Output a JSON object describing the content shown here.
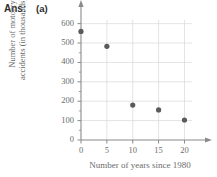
{
  "answer": {
    "prefix": "Ans:",
    "part": "(a)"
  },
  "chart_data": {
    "type": "scatter",
    "title": "",
    "xlabel": "Number of years since 1980",
    "ylabel": "Number of motorcycle accidents (in thousands)",
    "ylabel_line1": "Number of motorcycle",
    "ylabel_line2": "accidents (in thousands)",
    "x": [
      0,
      5,
      10,
      15,
      20
    ],
    "values": [
      560,
      483,
      180,
      155,
      103
    ],
    "points": [
      {
        "x": 0,
        "y": 560
      },
      {
        "x": 5,
        "y": 483
      },
      {
        "x": 10,
        "y": 180
      },
      {
        "x": 15,
        "y": 155
      },
      {
        "x": 20,
        "y": 103
      }
    ],
    "xticks": [
      0,
      5,
      10,
      15,
      20
    ],
    "xtick_labels": [
      "0",
      "5",
      "10",
      "15",
      "20"
    ],
    "yticks": [
      0,
      100,
      200,
      300,
      400,
      500,
      600
    ],
    "ytick_labels": [
      "0",
      "100",
      "200",
      "300",
      "400",
      "500",
      "600"
    ],
    "y_minor_step": 50,
    "xlim": [
      0,
      23
    ],
    "ylim": [
      0,
      660
    ],
    "grid": true,
    "legend": null,
    "marker_color": "#5a5a5a",
    "grid_color": "#d8d8d8",
    "axis_color": "#8a8a8a",
    "text_color": "#6b6b6b"
  }
}
